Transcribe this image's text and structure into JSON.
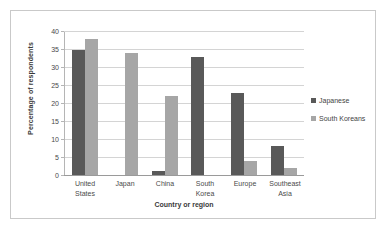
{
  "chart_data": {
    "type": "bar",
    "title": "",
    "subtitle": "",
    "xlabel": "Country or region",
    "ylabel": "Percentage of respondents",
    "categories": [
      "United States",
      "Japan",
      "China",
      "South Korea",
      "Europe",
      "Southeast Asia"
    ],
    "category_lines": [
      [
        "United",
        "States"
      ],
      [
        "Japan"
      ],
      [
        "China"
      ],
      [
        "South",
        "Korea"
      ],
      [
        "Europe"
      ],
      [
        "Southeast",
        "Asia"
      ]
    ],
    "series": [
      {
        "name": "Japanese",
        "color": "#595959",
        "values": [
          35,
          0,
          1,
          33,
          23,
          8
        ]
      },
      {
        "name": "South Koreans",
        "color": "#a6a6a6",
        "values": [
          38,
          34,
          22,
          0,
          4,
          2
        ]
      }
    ],
    "ylim": [
      0,
      40
    ],
    "ytick_step": 5,
    "yticks": [
      0,
      5,
      10,
      15,
      20,
      25,
      30,
      35,
      40
    ],
    "ytick_labels": [
      "0",
      "5",
      "10",
      "15",
      "20",
      "25",
      "30",
      "35",
      "40"
    ],
    "grid": true,
    "grid_axis": "y",
    "legend_position": "right",
    "background": "#ffffff",
    "frame_color": "#c9c9c9"
  }
}
